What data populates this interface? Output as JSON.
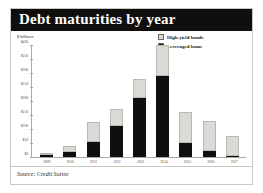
{
  "card": {
    "title": "Debt maturities by year",
    "source": "Source: Credit Suisse",
    "unit_label": "$ billions"
  },
  "legend": {
    "position": "top-right",
    "items": [
      {
        "label": "High-yield bonds",
        "color": "#d9d9d6",
        "marker": "square"
      },
      {
        "label": "Leveraged loans",
        "color": "#100f0d",
        "marker": "square"
      }
    ]
  },
  "colors": {
    "title_bar": "#100f0d",
    "title_text": "#ffffff",
    "high_yield_bonds": "#d9d9d6",
    "leveraged_loans": "#100f0d",
    "axis": "#aaa9a5",
    "card_border": "#c8c8c4",
    "page_background": "#ffffff"
  },
  "chart_data": {
    "type": "bar",
    "title": "Debt maturities by year",
    "xlabel": "",
    "ylabel": "$ billions",
    "ylim": [
      0,
      400
    ],
    "yticks": [
      0,
      50,
      100,
      150,
      200,
      250,
      300,
      350,
      400
    ],
    "ytick_labels": [
      "$0",
      "$50",
      "$100",
      "$150",
      "$200",
      "$250",
      "$300",
      "$350",
      "$400"
    ],
    "grid": false,
    "stacked": true,
    "legend_position": "top-right",
    "categories": [
      "2009",
      "2010",
      "2011",
      "2012",
      "2013",
      "2014",
      "2015",
      "2016",
      "2017"
    ],
    "series": [
      {
        "name": "Leveraged loans",
        "color": "#100f0d",
        "values": [
          6,
          18,
          52,
          110,
          212,
          290,
          50,
          20,
          2
        ]
      },
      {
        "name": "High-yield bonds",
        "color": "#d9d9d6",
        "values": [
          4,
          22,
          72,
          62,
          68,
          110,
          112,
          110,
          72
        ]
      }
    ],
    "totals": [
      10,
      40,
      124,
      172,
      280,
      400,
      162,
      130,
      74
    ],
    "annotations": [],
    "source": "Source: Credit Suisse"
  }
}
